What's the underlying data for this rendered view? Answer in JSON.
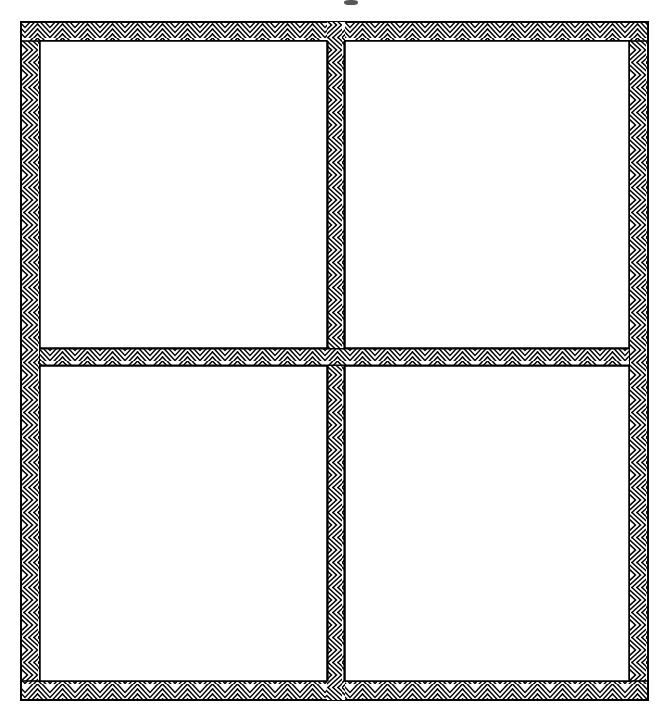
{
  "document": {
    "type": "patent-line-drawing",
    "title": "Four-pane window frame assembly, sectional view",
    "background_color": "#ffffff",
    "ink_color": "#000000",
    "canvas": {
      "width": 669,
      "height": 711
    }
  },
  "figure": {
    "name": "window-frame-assembly",
    "outer_frame": {
      "label": "outer-frame",
      "x": 21,
      "y": 22,
      "width": 627,
      "height": 678,
      "member_thickness": 19,
      "outline_width": 1.6,
      "hatch": "chevron"
    },
    "mullion": {
      "label": "vertical-mullion",
      "orientation": "vertical",
      "x": 327,
      "y": 22,
      "width": 18,
      "height": 678,
      "hatch": "chevron-vertical"
    },
    "rail": {
      "label": "horizontal-rail",
      "orientation": "horizontal",
      "x": 21,
      "y": 348,
      "width": 627,
      "height": 18,
      "hatch": "chevron-horizontal"
    },
    "panes": [
      {
        "label": "pane-top-left",
        "position": "top-left",
        "x": 40,
        "y": 41,
        "width": 287,
        "height": 307,
        "fill": "#ffffff"
      },
      {
        "label": "pane-top-right",
        "position": "top-right",
        "x": 345,
        "y": 41,
        "width": 284,
        "height": 307,
        "fill": "#ffffff"
      },
      {
        "label": "pane-bottom-left",
        "position": "bottom-left",
        "x": 40,
        "y": 366,
        "width": 287,
        "height": 315,
        "fill": "#ffffff"
      },
      {
        "label": "pane-bottom-right",
        "position": "bottom-right",
        "x": 345,
        "y": 366,
        "width": 284,
        "height": 315,
        "fill": "#ffffff"
      }
    ],
    "hatch_pattern": {
      "style": "chevron",
      "period_px": 25,
      "stroke_color": "#000000",
      "stroke_width": 1.5,
      "fill_color": "#ffffff"
    },
    "crop_artifact": {
      "label": "cropped-caption-mark",
      "note": "Small dark mark clipped at the top edge, remnant of a caption above the crop.",
      "x": 344,
      "y": 0,
      "width": 14,
      "height": 5,
      "color": "#3a3a3a"
    }
  },
  "annotations": {
    "reference_numerals": [],
    "caption": "",
    "leader_lines": []
  }
}
